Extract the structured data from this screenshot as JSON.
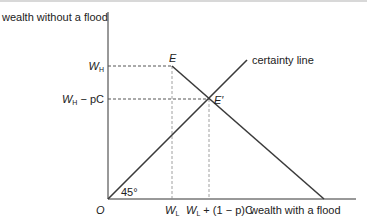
{
  "diagram": {
    "y_axis_label": "wealth without a flood",
    "x_axis_label": "wealth with a flood",
    "origin_label": "O",
    "angle_label": "45°",
    "certainty_line_label": "certainty line",
    "point_E": "E",
    "point_E_prime": "E′",
    "y_ticks": [
      {
        "main": "W",
        "sub": "H",
        "rest": ""
      },
      {
        "main": "W",
        "sub": "H",
        "rest": " − pC"
      }
    ],
    "x_ticks": [
      {
        "main": "W",
        "sub": "L",
        "rest": ""
      },
      {
        "main": "W",
        "sub": "L",
        "rest": " + (1 − p)C"
      }
    ],
    "colors": {
      "line": "#3a3a3a",
      "dashed": "#555555",
      "text": "#222222"
    }
  }
}
